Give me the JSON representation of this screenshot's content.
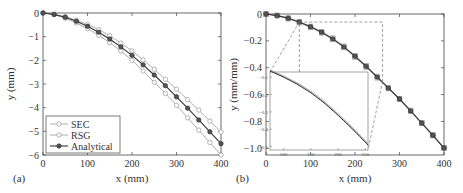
{
  "chart_data": [
    {
      "type": "line",
      "panel_label": "(a)",
      "xlabel": "x (mm)",
      "ylabel": "y (mm)",
      "xlim": [
        0,
        400
      ],
      "ylim": [
        -6,
        0
      ],
      "xticks": [
        0,
        100,
        200,
        300,
        400
      ],
      "yticks": [
        0,
        -1,
        -2,
        -3,
        -4,
        -5,
        -6
      ],
      "legend": {
        "position": "lower left",
        "entries": [
          "SEC",
          "RSG",
          "Analytical"
        ]
      },
      "x": [
        0,
        25,
        50,
        75,
        100,
        125,
        150,
        175,
        200,
        225,
        250,
        275,
        300,
        325,
        350,
        375,
        400
      ],
      "series": [
        {
          "name": "SEC",
          "marker": "open-circle",
          "color": "#999999",
          "values": [
            0,
            -0.07,
            -0.22,
            -0.42,
            -0.66,
            -0.94,
            -1.25,
            -1.6,
            -2.0,
            -2.45,
            -2.93,
            -3.4,
            -3.9,
            -4.43,
            -4.95,
            -5.47,
            -6.0
          ]
        },
        {
          "name": "RSG",
          "marker": "open-circle",
          "color": "#999999",
          "values": [
            0,
            -0.05,
            -0.15,
            -0.3,
            -0.48,
            -0.7,
            -0.96,
            -1.27,
            -1.6,
            -1.98,
            -2.38,
            -2.8,
            -3.22,
            -3.66,
            -4.1,
            -4.57,
            -5.03
          ]
        },
        {
          "name": "Analytical",
          "marker": "filled-circle",
          "color": "#333333",
          "values": [
            0,
            -0.06,
            -0.18,
            -0.35,
            -0.56,
            -0.81,
            -1.1,
            -1.43,
            -1.79,
            -2.19,
            -2.62,
            -3.07,
            -3.54,
            -4.02,
            -4.52,
            -5.02,
            -5.52
          ]
        }
      ]
    },
    {
      "type": "line",
      "panel_label": "(b)",
      "xlabel": "x (mm)",
      "ylabel": "y (mm/mm)",
      "xlim": [
        0,
        400
      ],
      "ylim": [
        -1.05,
        0
      ],
      "xticks": [
        0,
        100,
        200,
        300,
        400
      ],
      "yticks": [
        0,
        -0.2,
        -0.4,
        -0.6,
        -0.8,
        -1.0
      ],
      "x": [
        0,
        25,
        50,
        75,
        100,
        125,
        150,
        175,
        200,
        225,
        250,
        275,
        300,
        325,
        350,
        375,
        400
      ],
      "series": [
        {
          "name": "SEC",
          "marker": "open-square",
          "color": "#999999",
          "values": [
            0,
            -0.013,
            -0.035,
            -0.065,
            -0.1,
            -0.14,
            -0.19,
            -0.25,
            -0.32,
            -0.395,
            -0.475,
            -0.555,
            -0.635,
            -0.725,
            -0.815,
            -0.905,
            -1.0
          ]
        },
        {
          "name": "RSG",
          "marker": "open-square",
          "color": "#999999",
          "values": [
            0,
            -0.01,
            -0.03,
            -0.058,
            -0.092,
            -0.132,
            -0.18,
            -0.24,
            -0.31,
            -0.385,
            -0.465,
            -0.548,
            -0.63,
            -0.718,
            -0.81,
            -0.9,
            -0.995
          ]
        },
        {
          "name": "Analytical",
          "marker": "filled-circle",
          "color": "#333333",
          "values": [
            0,
            -0.012,
            -0.032,
            -0.06,
            -0.095,
            -0.136,
            -0.185,
            -0.245,
            -0.315,
            -0.39,
            -0.47,
            -0.552,
            -0.633,
            -0.722,
            -0.812,
            -0.903,
            -0.998
          ]
        }
      ],
      "zoom_box": {
        "x_range": [
          75,
          262
        ],
        "y_range": [
          -0.06,
          -0.5
        ]
      },
      "inset": {
        "xticks": [
          100,
          150,
          200,
          250
        ],
        "yticks": [
          -0.1,
          -0.2,
          -0.3,
          -0.4,
          -0.5
        ],
        "xlim": [
          75,
          255
        ],
        "ylim": [
          -0.52,
          -0.07
        ]
      }
    }
  ],
  "panel_a": {
    "label": "(a)",
    "xlabel": "x (mm)",
    "ylabel": "y (mm)",
    "xticks": [
      "0",
      "100",
      "200",
      "300",
      "400"
    ],
    "yticks": [
      "0",
      "−1",
      "−2",
      "−3",
      "−4",
      "−5",
      "−6"
    ],
    "legend": [
      "SEC",
      "RSG",
      "Analytical"
    ]
  },
  "panel_b": {
    "label": "(b)",
    "xlabel": "x (mm)",
    "ylabel": "y (mm/mm)",
    "xticks": [
      "0",
      "100",
      "200",
      "300",
      "400"
    ],
    "yticks": [
      "0",
      "−0.2",
      "−0.4",
      "−0.6",
      "−0.8",
      "−1.0"
    ],
    "inset_xticks": [
      "100",
      "150",
      "200",
      "250"
    ],
    "inset_yticks": [
      "−0.1",
      "−0.2",
      "−0.3",
      "−0.4",
      "−0.5"
    ]
  }
}
